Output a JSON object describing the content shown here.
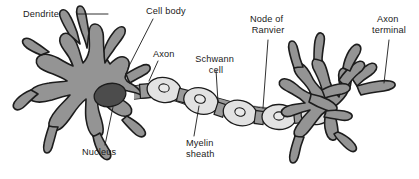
{
  "figure": {
    "background_color": "#ffffff",
    "line_color": "#1a1a1a"
  },
  "colors": {
    "soma_fill": "#949494",
    "soma_outline": "#1c1c1c",
    "nucleus_fill": "#4c4c4c",
    "myelin_fill": "#e2e2e2",
    "myelin_nucleus_fill": "#e9e9e9",
    "node_fill": "#9a9a9a",
    "label_text": "#1a1a1a"
  },
  "labels": [
    {
      "id": "dendrite",
      "name": "dendrite-label",
      "lines": [
        "Dendrite"
      ],
      "text": "Dendrite",
      "x": 23,
      "y": 17,
      "anchor": "start"
    },
    {
      "id": "cell-body",
      "name": "cell-body-label",
      "lines": [
        "Cell body"
      ],
      "text": "Cell body",
      "x": 146,
      "y": 14,
      "anchor": "start"
    },
    {
      "id": "axon",
      "name": "axon-label",
      "lines": [
        "Axon"
      ],
      "text": "Axon",
      "x": 153,
      "y": 57,
      "anchor": "start"
    },
    {
      "id": "schwann-cell",
      "name": "schwann-cell-label",
      "lines": [
        "Schwann",
        "cell"
      ],
      "text": "Schwann cell",
      "x": 216,
      "y": 62,
      "anchor": "middle"
    },
    {
      "id": "node-of-ranvier",
      "name": "node-of-ranvier-label",
      "lines": [
        "Node of",
        "Ranvier"
      ],
      "text": "Node of Ranvier",
      "x": 268,
      "y": 22,
      "anchor": "middle"
    },
    {
      "id": "axon-terminal",
      "name": "axon-terminal-label",
      "lines": [
        "Axon",
        "terminal"
      ],
      "text": "Axon terminal",
      "x": 389,
      "y": 22,
      "anchor": "middle"
    },
    {
      "id": "nucleus",
      "name": "nucleus-label",
      "lines": [
        "Nucleus"
      ],
      "text": "Nucleus",
      "x": 82,
      "y": 155,
      "anchor": "start"
    },
    {
      "id": "myelin-sheath",
      "name": "myelin-sheath-label",
      "lines": [
        "Myelin",
        "sheath"
      ],
      "text": "Myelin sheath",
      "x": 186,
      "y": 146,
      "anchor": "start"
    }
  ],
  "structures": {
    "soma": "cell-body",
    "nucleus": "nucleus",
    "dendrites": "dendrite-branches",
    "axon": "axon-fiber",
    "myelin_segments": 5,
    "nodes_of_ranvier": 4,
    "axon_terminal": "terminal-branches"
  }
}
